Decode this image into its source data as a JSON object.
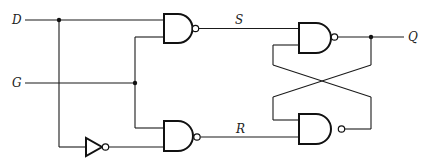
{
  "diagram": {
    "labels": {
      "input_d": "D",
      "input_g": "G",
      "signal_s": "S",
      "signal_r": "R",
      "output_q": "Q"
    },
    "components": [
      {
        "id": "nand1",
        "type": "NAND",
        "inputs": [
          "D",
          "G"
        ],
        "output": "S"
      },
      {
        "id": "nand2",
        "type": "NAND",
        "inputs": [
          "G",
          "NOT D"
        ],
        "output": "R"
      },
      {
        "id": "not1",
        "type": "NOT",
        "input": "D",
        "output": "NOT D"
      },
      {
        "id": "nand3",
        "type": "NAND",
        "inputs": [
          "S",
          "nand4.out"
        ],
        "output": "Q"
      },
      {
        "id": "nand4",
        "type": "NAND",
        "inputs": [
          "nand3.out",
          "R"
        ],
        "output": "Q'"
      }
    ],
    "colors": {
      "line": "#111111",
      "background": "#ffffff"
    }
  }
}
